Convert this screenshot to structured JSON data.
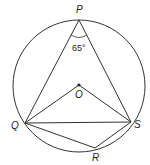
{
  "diagram": {
    "type": "circle-geometry",
    "circle": {
      "cx": 79,
      "cy": 86,
      "r": 66
    },
    "points": {
      "P": {
        "x": 79,
        "y": 20,
        "label": "P"
      },
      "O": {
        "x": 79,
        "y": 85,
        "label": "O"
      },
      "Q": {
        "x": 25,
        "y": 123,
        "label": "Q"
      },
      "S": {
        "x": 131,
        "y": 122,
        "label": "S"
      },
      "R": {
        "x": 95,
        "y": 148,
        "label": "R"
      }
    },
    "segments": [
      "PQ",
      "PS",
      "QO",
      "OS",
      "QS",
      "QR",
      "RS"
    ],
    "angle_label": "65°",
    "angle_at": "P",
    "stroke_color": "#333333"
  }
}
